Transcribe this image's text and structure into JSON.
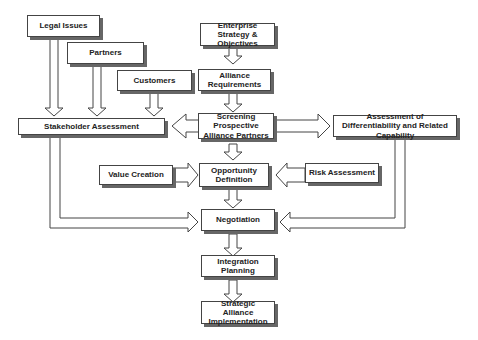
{
  "diagram": {
    "nodes": {
      "legal": {
        "label": "Legal Issues"
      },
      "partners": {
        "label": "Partners"
      },
      "customers": {
        "label": "Customers"
      },
      "enterprise": {
        "label": "Enterprise Strategy & Objectives"
      },
      "requirements": {
        "label": "Alliance Requirements"
      },
      "stakeholder": {
        "label": "Stakeholder Assessment"
      },
      "screening": {
        "label": "Screening Prospective Alliance Partners"
      },
      "differentiability": {
        "label": "Assessment of Differentiability and Related Capability"
      },
      "value": {
        "label": "Value Creation"
      },
      "opportunity": {
        "label": "Opportunity Definition"
      },
      "risk": {
        "label": "Risk Assessment"
      },
      "negotiation": {
        "label": "Negotiation"
      },
      "integration": {
        "label": "Integration Planning"
      },
      "implementation": {
        "label": "Strategic Alliance Implementation"
      }
    },
    "edges": [
      [
        "Legal Issues",
        "Stakeholder Assessment"
      ],
      [
        "Partners",
        "Stakeholder Assessment"
      ],
      [
        "Customers",
        "Stakeholder Assessment"
      ],
      [
        "Enterprise Strategy & Objectives",
        "Alliance Requirements"
      ],
      [
        "Alliance Requirements",
        "Screening Prospective Alliance Partners"
      ],
      [
        "Screening Prospective Alliance Partners",
        "Stakeholder Assessment"
      ],
      [
        "Screening Prospective Alliance Partners",
        "Assessment of Differentiability and Related Capability"
      ],
      [
        "Screening Prospective Alliance Partners",
        "Opportunity Definition"
      ],
      [
        "Value Creation",
        "Opportunity Definition"
      ],
      [
        "Risk Assessment",
        "Opportunity Definition"
      ],
      [
        "Opportunity Definition",
        "Negotiation"
      ],
      [
        "Stakeholder Assessment",
        "Negotiation"
      ],
      [
        "Assessment of Differentiability and Related Capability",
        "Negotiation"
      ],
      [
        "Negotiation",
        "Integration Planning"
      ],
      [
        "Integration Planning",
        "Strategic Alliance Implementation"
      ]
    ]
  }
}
